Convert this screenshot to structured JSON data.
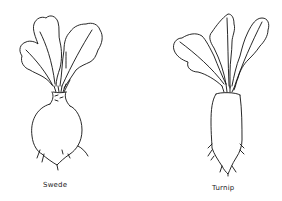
{
  "figures": [
    {
      "name": "swede",
      "label": "Swede"
    },
    {
      "name": "turnip",
      "label": "Turnip"
    }
  ],
  "colors": {
    "line": "#111111",
    "background": "#ffffff"
  }
}
